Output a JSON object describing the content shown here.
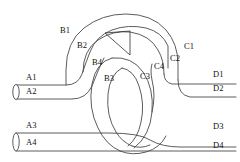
{
  "figure": {
    "type": "tube-knot-diagram",
    "background_color": "#ffffff",
    "stroke_color": "#4a4a4a",
    "label_color": "#111111",
    "width": 240,
    "height": 162
  },
  "labels": {
    "a1": "A1",
    "a2": "A2",
    "a3": "A3",
    "a4": "A4",
    "b1": "B1",
    "b2": "B2",
    "b3": "B3",
    "b4": "B4",
    "c1": "C1",
    "c2": "C2",
    "c3": "C3",
    "c4": "C4",
    "d1": "D1",
    "d2": "D2",
    "d3": "D3",
    "d4": "D4"
  },
  "label_positions": {
    "a1": {
      "x": 26,
      "y": 80
    },
    "a2": {
      "x": 26,
      "y": 94
    },
    "a3": {
      "x": 26,
      "y": 128
    },
    "a4": {
      "x": 26,
      "y": 145
    },
    "b1": {
      "x": 60,
      "y": 33
    },
    "b2": {
      "x": 77,
      "y": 48
    },
    "b3": {
      "x": 104,
      "y": 81
    },
    "b4": {
      "x": 92,
      "y": 65
    },
    "c1": {
      "x": 184,
      "y": 49
    },
    "c2": {
      "x": 170,
      "y": 61
    },
    "c3": {
      "x": 140,
      "y": 79
    },
    "c4": {
      "x": 154,
      "y": 69
    },
    "d1": {
      "x": 213,
      "y": 77
    },
    "d2": {
      "x": 213,
      "y": 91
    },
    "d3": {
      "x": 213,
      "y": 129
    },
    "d4": {
      "x": 213,
      "y": 148
    }
  }
}
